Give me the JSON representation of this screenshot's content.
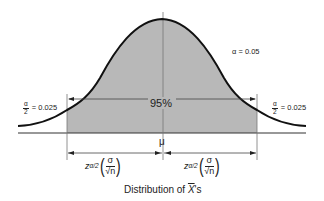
{
  "diagram": {
    "caption_prefix": "Distribution of ",
    "caption_var": "X",
    "caption_suffix": "'s",
    "alpha_label": "α = 0.05",
    "center_label": "95%",
    "mean_label": "μ",
    "left_tail": {
      "num": "α",
      "den": "2",
      "value": "= 0.025"
    },
    "right_tail": {
      "num": "α",
      "den": "2",
      "value": "= 0.025"
    },
    "margin_left": {
      "z": "z",
      "sub": "α/2",
      "num": "σ",
      "den": "√n"
    },
    "margin_right": {
      "z": "z",
      "sub": "α/2",
      "num": "σ",
      "den": "√n"
    },
    "colors": {
      "curve": "#111111",
      "shade": "#b8b8b8",
      "lines": "#555555"
    }
  }
}
